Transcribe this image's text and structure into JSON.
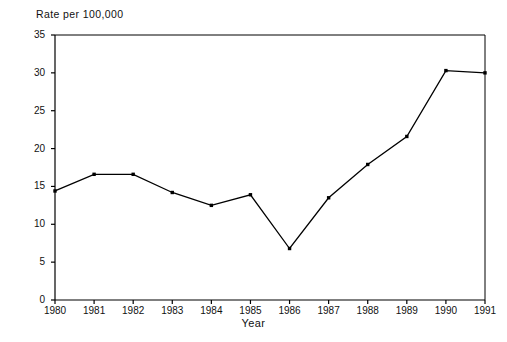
{
  "chart_data": {
    "type": "line",
    "title": "",
    "xlabel": "Year",
    "ylabel": "Rate per 100,000",
    "ylabel_position": "top-left",
    "categories": [
      "1980",
      "1981",
      "1982",
      "1983",
      "1984",
      "1985",
      "1986",
      "1987",
      "1988",
      "1989",
      "1990",
      "1991"
    ],
    "x": [
      1980,
      1981,
      1982,
      1983,
      1984,
      1985,
      1986,
      1987,
      1988,
      1989,
      1990,
      1991
    ],
    "values": [
      14.4,
      16.6,
      16.6,
      14.2,
      12.5,
      13.9,
      6.8,
      13.5,
      17.9,
      21.6,
      30.3,
      30.0
    ],
    "series": [
      {
        "name": "Rate per 100,000",
        "values": [
          14.4,
          16.6,
          16.6,
          14.2,
          12.5,
          13.9,
          6.8,
          13.5,
          17.9,
          21.6,
          30.3,
          30.0
        ]
      }
    ],
    "ylim": [
      0,
      35
    ],
    "xlim": [
      1980,
      1991
    ],
    "yticks": [
      0,
      5,
      10,
      15,
      20,
      25,
      30,
      35
    ],
    "ytick_labels": [
      "0",
      "5",
      "10",
      "15",
      "20",
      "25",
      "30",
      "35"
    ],
    "xtick_labels": [
      "1980",
      "1981",
      "1982",
      "1983",
      "1984",
      "1985",
      "1986",
      "1987",
      "1988",
      "1989",
      "1990",
      "1991"
    ],
    "grid": false,
    "legend": null,
    "legend_position": "none",
    "line_color": "#000000",
    "marker": "square",
    "marker_color": "#000000",
    "background_color": "#ffffff",
    "axis_color": "#000000"
  }
}
